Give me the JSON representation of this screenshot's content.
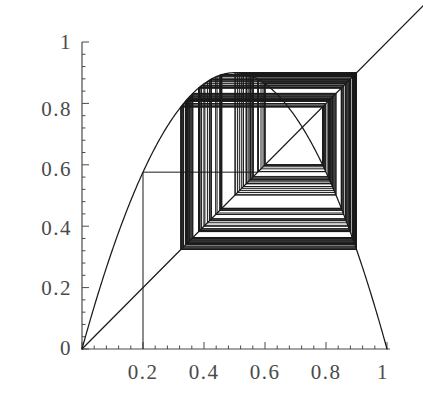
{
  "chart_data": {
    "type": "line",
    "title": "",
    "subtitle": "",
    "xlabel": "",
    "ylabel": "",
    "xlim": [
      0,
      1
    ],
    "ylim": [
      0,
      1
    ],
    "grid": false,
    "legend": null,
    "x_ticks": [
      {
        "value": 0,
        "label": ""
      },
      {
        "value": 0.2,
        "label": "0.2"
      },
      {
        "value": 0.4,
        "label": "0.4"
      },
      {
        "value": 0.6,
        "label": "0.6"
      },
      {
        "value": 0.8,
        "label": "0.8"
      },
      {
        "value": 1,
        "label": "1"
      }
    ],
    "y_ticks": [
      {
        "value": 0,
        "label": "0"
      },
      {
        "value": 0.2,
        "label": "0.2"
      },
      {
        "value": 0.4,
        "label": "0.4"
      },
      {
        "value": 0.6,
        "label": "0.6"
      },
      {
        "value": 0.8,
        "label": "0.8"
      },
      {
        "value": 1,
        "label": "1"
      }
    ],
    "x_minor_ticks_per_interval": 4,
    "y_minor_ticks_per_interval": 4,
    "series": [
      {
        "name": "logistic-map-curve",
        "type": "line",
        "description": "f(x) = r*x*(1-x) parabola, peak 0.9 at x=0.5",
        "r": 3.6,
        "color": "#1a1a1a",
        "x": [
          0,
          0.05,
          0.1,
          0.15,
          0.2,
          0.25,
          0.3,
          0.35,
          0.4,
          0.45,
          0.5,
          0.55,
          0.6,
          0.65,
          0.7,
          0.75,
          0.8,
          0.85,
          0.9,
          0.95,
          1
        ],
        "y": [
          0,
          0.171,
          0.324,
          0.459,
          0.576,
          0.675,
          0.756,
          0.819,
          0.864,
          0.891,
          0.9,
          0.891,
          0.864,
          0.819,
          0.756,
          0.675,
          0.576,
          0.459,
          0.324,
          0.171,
          0
        ]
      },
      {
        "name": "identity-diagonal",
        "type": "line",
        "description": "y = x reference line extending past plot corner",
        "color": "#1a1a1a",
        "x": [
          0,
          1.12
        ],
        "y": [
          0,
          1.12
        ]
      },
      {
        "name": "cobweb-orbit",
        "type": "line",
        "description": "Cobweb iteration staircase starting at x0 = 0.2, chaotic attractor band between 0.34 and 0.90",
        "color": "#1a1a1a",
        "x0": 0.2,
        "iterations": 140,
        "orbit": [
          0.2,
          0.576,
          0.879,
          0.383,
          0.851,
          0.457,
          0.894,
          0.342,
          0.81,
          0.554,
          0.89,
          0.353,
          0.823,
          0.524,
          0.898,
          0.33,
          0.796,
          0.585,
          0.874,
          0.397,
          0.862,
          0.428,
          0.882,
          0.375,
          0.844,
          0.474,
          0.897,
          0.333,
          0.8,
          0.576,
          0.879,
          0.383,
          0.851,
          0.457,
          0.894,
          0.342,
          0.81,
          0.554,
          0.89,
          0.353
        ]
      }
    ],
    "annotations": [
      {
        "name": "attractor-band-top",
        "value": 0.9
      },
      {
        "name": "attractor-band-bottom",
        "value": 0.34
      },
      {
        "name": "initial-value-x0",
        "value": 0.2
      },
      {
        "name": "first-image-f-x0",
        "value": 0.576
      }
    ],
    "axes": {
      "x_axis_color": "#4a4a4a",
      "y_axis_color": "#4a4a4a",
      "line_color": "#1a1a1a",
      "background": "#ffffff"
    }
  }
}
